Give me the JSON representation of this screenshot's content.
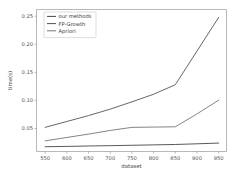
{
  "chart_data": {
    "type": "line",
    "title": "",
    "xlabel": "dataset",
    "ylabel": "time(s)",
    "x": [
      550,
      600,
      650,
      700,
      750,
      800,
      850,
      900,
      950
    ],
    "xlim": [
      530,
      968
    ],
    "ylim": [
      0.009,
      0.262
    ],
    "xticks": [
      550,
      600,
      650,
      700,
      750,
      800,
      850,
      900,
      950
    ],
    "xtick_labels": [
      "550",
      "600",
      "650",
      "700",
      "750",
      "800",
      "850",
      "900",
      "950"
    ],
    "yticks": [
      0.05,
      0.1,
      0.15,
      0.2,
      0.25
    ],
    "ytick_labels": [
      "0.05",
      "0.10",
      "0.15",
      "0.20",
      "0.25"
    ],
    "grid": false,
    "legend_position": "upper left",
    "series": [
      {
        "name": "our methods",
        "color": "#3b3b3b",
        "values": [
          0.0175,
          0.0181,
          0.0188,
          0.0194,
          0.0201,
          0.0208,
          0.0215,
          0.0227,
          0.024
        ]
      },
      {
        "name": "FP-Growth",
        "color": "#4a4a4a",
        "values": [
          0.052,
          0.0625,
          0.073,
          0.0845,
          0.0975,
          0.111,
          0.128,
          0.188,
          0.248
        ]
      },
      {
        "name": "Apriori",
        "color": "#6e6e6e",
        "values": [
          0.028,
          0.034,
          0.04,
          0.0465,
          0.052,
          0.0525,
          0.053,
          0.076,
          0.1005
        ]
      }
    ]
  },
  "legend": {
    "entries": [
      "our methods",
      "FP-Growth",
      "Apriori"
    ]
  },
  "colors": {
    "background": "#ffffff",
    "spine": "#9a9a9a",
    "tick_text": "#555555",
    "axis_title": "#444444"
  }
}
